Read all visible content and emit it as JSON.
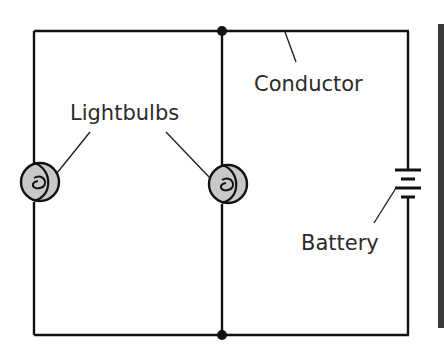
{
  "diagram": {
    "labels": {
      "conductor": "Conductor",
      "lightbulbs": "Lightbulbs",
      "battery": "Battery"
    },
    "components": [
      {
        "type": "lightbulb",
        "name": "left-bulb"
      },
      {
        "type": "lightbulb",
        "name": "middle-bulb"
      },
      {
        "type": "battery",
        "name": "battery"
      },
      {
        "type": "junction",
        "name": "top-junction"
      },
      {
        "type": "junction",
        "name": "bottom-junction"
      }
    ],
    "colors": {
      "wire": "#111111",
      "bulb_fill": "#c8c8c8",
      "text": "#2b2b2b",
      "edge_bar": "#3a3a3a"
    }
  }
}
